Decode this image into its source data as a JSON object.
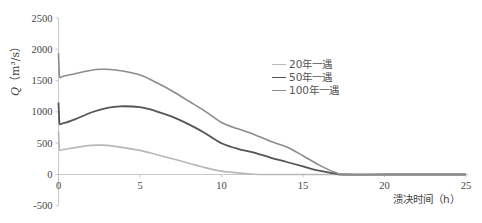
{
  "chart_data": {
    "type": "line",
    "title": "",
    "xlabel": "溃决时间（h）",
    "ylabel": "Q（m³/s）",
    "ylabel_symbol": "Q",
    "ylabel_unit": "（m³/s）",
    "xlim": [
      0,
      25
    ],
    "ylim": [
      -500,
      2500
    ],
    "x_ticks": [
      0,
      5,
      10,
      15,
      20,
      25
    ],
    "y_ticks": [
      -500,
      0,
      500,
      1000,
      1500,
      2000,
      2500
    ],
    "grid": false,
    "legend_position": "upper-center-right",
    "series": [
      {
        "name": "20年一遇",
        "color": "#b8b8b8",
        "x": [
          0,
          0.05,
          0.3,
          1,
          2,
          2.5,
          3,
          4,
          5,
          6,
          7,
          8,
          9,
          10,
          11,
          12,
          13,
          15,
          18,
          25
        ],
        "y": [
          690,
          410,
          400,
          430,
          465,
          470,
          465,
          430,
          385,
          320,
          250,
          180,
          110,
          55,
          25,
          5,
          0,
          0,
          0,
          0
        ]
      },
      {
        "name": "50年一遇",
        "color": "#555555",
        "x": [
          0,
          0.05,
          0.3,
          1,
          2,
          3,
          3.8,
          5,
          6,
          7,
          8,
          9,
          10,
          11,
          12,
          13,
          14,
          15,
          16,
          17,
          17.5,
          20,
          25
        ],
        "y": [
          1150,
          830,
          820,
          880,
          990,
          1065,
          1090,
          1075,
          1010,
          920,
          800,
          660,
          500,
          410,
          350,
          270,
          200,
          130,
          60,
          15,
          0,
          0,
          0
        ]
      },
      {
        "name": "100年一遇",
        "color": "#8c8c8c",
        "x": [
          0,
          0.05,
          0.3,
          1,
          2,
          2.6,
          3.5,
          5,
          6,
          7,
          8,
          9,
          10,
          11,
          12,
          13,
          14,
          15,
          16,
          17,
          17.5,
          20,
          25
        ],
        "y": [
          1940,
          1580,
          1570,
          1610,
          1665,
          1680,
          1670,
          1590,
          1470,
          1330,
          1170,
          1010,
          830,
          730,
          640,
          530,
          440,
          300,
          150,
          30,
          0,
          0,
          0
        ]
      }
    ]
  },
  "legend": {
    "items": [
      {
        "label": "20年一遇",
        "color": "#b8b8b8"
      },
      {
        "label": "50年一遇",
        "color": "#555555"
      },
      {
        "label": "100年一遇",
        "color": "#8c8c8c"
      }
    ]
  },
  "axes": {
    "x_title": "溃决时间（h）",
    "y_symbol": "Q",
    "y_unit": "（m³/s）"
  }
}
